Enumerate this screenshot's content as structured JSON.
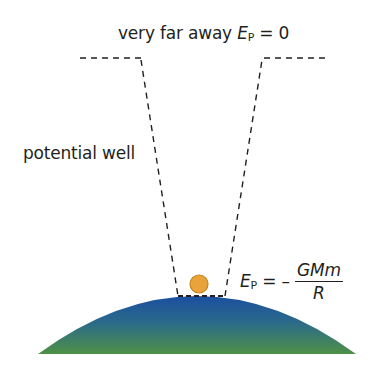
{
  "labels": {
    "top": {
      "text": "very far away ",
      "E": "E",
      "sub": "P",
      "rhs": " = 0"
    },
    "left": "potential well",
    "formula": {
      "E": "E",
      "sub": "P",
      "eq": " = – ",
      "numerator": "GMm",
      "denominator": "R"
    }
  },
  "colors": {
    "dash": "#231f20",
    "ball_fill": "#e8a33a",
    "ball_stroke": "#c98418",
    "planet_top": "#1e55a3",
    "planet_bottom": "#4e8f45"
  },
  "elements": {
    "planet": "planet-surface",
    "ball": "mass-ball",
    "well": "potential-well-outline"
  }
}
